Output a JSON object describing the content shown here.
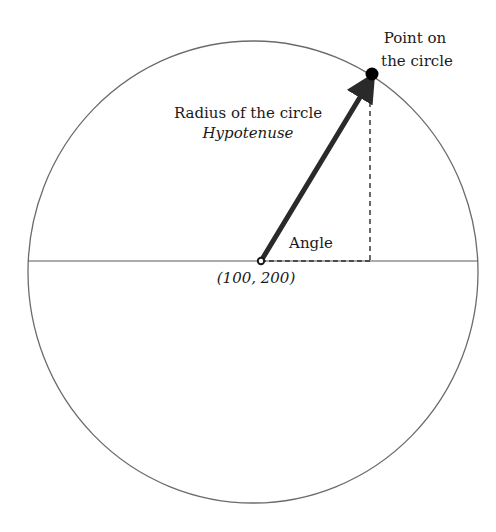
{
  "diagram": {
    "colors": {
      "background": "#ffffff",
      "circle_stroke": "#6b6b6b",
      "axis_stroke": "#5a5a5a",
      "radius_stroke": "#2a2a2a",
      "dashed_stroke": "#2a2a2a",
      "text": "#1a1a1a",
      "point_fill": "#000000"
    },
    "circle": {
      "cx": 253,
      "cy": 272,
      "rx": 225,
      "ry": 231
    },
    "center_point": {
      "x": 261,
      "y": 261,
      "label": "(100, 200)"
    },
    "point_on_circle": {
      "x": 372,
      "y": 74,
      "label_line1": "Point on",
      "label_line2": "the circle"
    },
    "radius": {
      "label_line1": "Radius of the circle",
      "label_line2": "Hypotenuse",
      "end_x": 368,
      "end_y": 84
    },
    "angle": {
      "label": "Angle"
    },
    "horizontal_axis": {
      "x1": 28,
      "x2": 478,
      "y": 261
    },
    "dashed_vertical": {
      "x": 370,
      "y1": 84,
      "y2": 261
    }
  }
}
